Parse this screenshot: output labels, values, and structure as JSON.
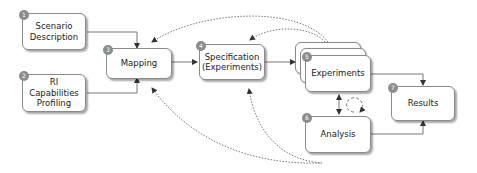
{
  "diagram": {
    "nodes": [
      {
        "id": 1,
        "badge": "1",
        "label": "Scenario\nDescription"
      },
      {
        "id": 2,
        "badge": "2",
        "label": "RI\nCapabilities\nProfiling"
      },
      {
        "id": 3,
        "badge": "3",
        "label": "Mapping"
      },
      {
        "id": 4,
        "badge": "4",
        "label": "Specification\n(Experiments)"
      },
      {
        "id": 5,
        "badge": "5",
        "label": "Experiments"
      },
      {
        "id": 6,
        "badge": "6",
        "label": "Analysis"
      },
      {
        "id": 7,
        "badge": "7",
        "label": "Results"
      }
    ],
    "edges": [
      {
        "from": "Scenario Description",
        "to": "Mapping",
        "style": "solid"
      },
      {
        "from": "RI Capabilities Profiling",
        "to": "Mapping",
        "style": "solid"
      },
      {
        "from": "Mapping",
        "to": "Specification (Experiments)",
        "style": "solid"
      },
      {
        "from": "Specification (Experiments)",
        "to": "Experiments",
        "style": "solid"
      },
      {
        "from": "Experiments",
        "to": "Results",
        "style": "solid"
      },
      {
        "from": "Analysis",
        "to": "Results",
        "style": "solid"
      },
      {
        "from": "Experiments",
        "to": "Analysis",
        "style": "solid-bidirectional"
      },
      {
        "from": "Experiments",
        "to": "Mapping",
        "style": "dotted"
      },
      {
        "from": "Experiments",
        "to": "Specification (Experiments)",
        "style": "dotted"
      },
      {
        "from": "Analysis",
        "to": "Mapping",
        "style": "dotted"
      },
      {
        "from": "Analysis",
        "to": "Specification (Experiments)",
        "style": "dotted"
      },
      {
        "from": "Analysis",
        "to": "Experiments",
        "style": "dashed-loop"
      }
    ],
    "colors": {
      "border": "#8a8a8a",
      "badge": "#8c8c8c",
      "arrow": "#333333",
      "text": "#222222"
    }
  }
}
